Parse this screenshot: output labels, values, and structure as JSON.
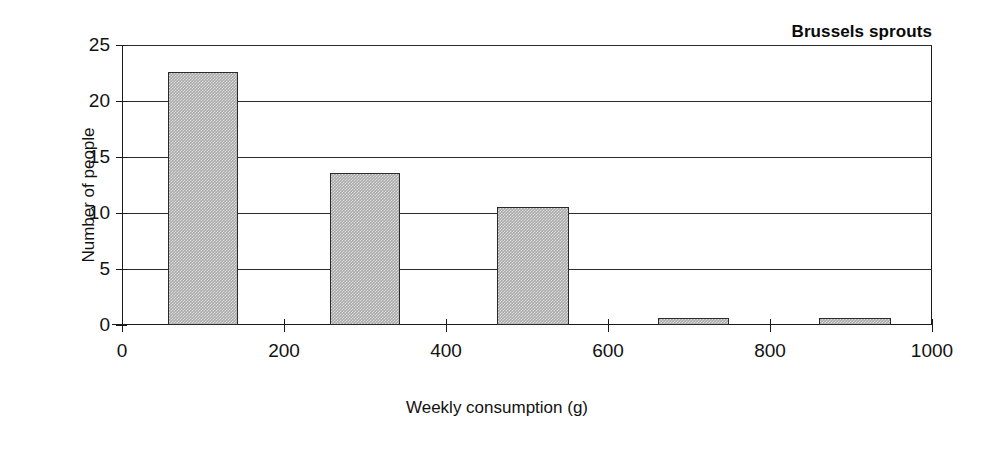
{
  "chart_data": {
    "type": "bar",
    "title": "Brussels sprouts",
    "xlabel": "Weekly consumption (g)",
    "ylabel": "Number of people",
    "xlim": [
      0,
      1000
    ],
    "ylim": [
      0,
      25
    ],
    "grid": true,
    "legend": null,
    "x_ticks": [
      0,
      200,
      400,
      600,
      800,
      1000
    ],
    "x_tick_labels": [
      "0",
      "200",
      "400",
      "600",
      "800",
      "1000"
    ],
    "y_ticks": [
      0,
      5,
      10,
      15,
      20,
      25
    ],
    "y_tick_labels": [
      "0",
      "5",
      "10",
      "15",
      "20",
      "25"
    ],
    "bar_color": "#a9a9a9",
    "bar_edge_color": "#2a2a2a",
    "bins": [
      {
        "label": "57-143",
        "x_start": 57,
        "x_end": 143,
        "value": 22.6
      },
      {
        "label": "257-343",
        "x_start": 257,
        "x_end": 343,
        "value": 13.6
      },
      {
        "label": "463-552",
        "x_start": 463,
        "x_end": 552,
        "value": 10.5
      },
      {
        "label": "662-749",
        "x_start": 662,
        "x_end": 749,
        "value": 0.6
      },
      {
        "label": "860-949",
        "x_start": 860,
        "x_end": 949,
        "value": 0.6
      }
    ],
    "categories": [
      "57-143",
      "257-343",
      "463-552",
      "662-749",
      "860-949"
    ],
    "values": [
      22.6,
      13.6,
      10.5,
      0.6,
      0.6
    ]
  }
}
